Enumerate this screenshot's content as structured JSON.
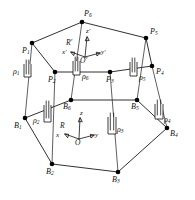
{
  "figure": {
    "background_color": "#ffffff",
    "line_color": "#1a1a1a"
  },
  "platform_nodes": [
    {
      "id": "P1",
      "base": "P",
      "sub": "1",
      "x": 32,
      "y": 43
    },
    {
      "id": "P2",
      "base": "P",
      "sub": "2",
      "x": 55,
      "y": 72
    },
    {
      "id": "P3",
      "base": "P",
      "sub": "3",
      "x": 110,
      "y": 72
    },
    {
      "id": "P4",
      "base": "P",
      "sub": "4",
      "x": 152,
      "y": 66
    },
    {
      "id": "P5",
      "base": "P",
      "sub": "5",
      "x": 146,
      "y": 38
    },
    {
      "id": "P6",
      "base": "P",
      "sub": "6",
      "x": 82,
      "y": 22
    }
  ],
  "base_nodes": [
    {
      "id": "B1",
      "base": "B",
      "sub": "1",
      "x": 25,
      "y": 118
    },
    {
      "id": "B2",
      "base": "B",
      "sub": "2",
      "x": 52,
      "y": 164
    },
    {
      "id": "B3",
      "base": "B",
      "sub": "3",
      "x": 118,
      "y": 172
    },
    {
      "id": "B4",
      "base": "B",
      "sub": "4",
      "x": 167,
      "y": 128
    },
    {
      "id": "B5",
      "base": "B",
      "sub": "5",
      "x": 137,
      "y": 100
    },
    {
      "id": "B6",
      "base": "B",
      "sub": "6",
      "x": 71,
      "y": 100
    }
  ],
  "actuators": [
    {
      "id": "rho1",
      "base": "ρ",
      "sub": "1",
      "label_x": 13,
      "label_y": 72
    },
    {
      "id": "rho2",
      "base": "ρ",
      "sub": "2",
      "label_x": 33,
      "label_y": 121
    },
    {
      "id": "rho3",
      "base": "ρ",
      "sub": "3",
      "label_x": 115,
      "label_y": 130
    },
    {
      "id": "rho4",
      "base": "ρ",
      "sub": "4",
      "label_x": 163,
      "label_y": 120
    },
    {
      "id": "rho5",
      "base": "ρ",
      "sub": "5",
      "label_x": 138,
      "label_y": 78
    },
    {
      "id": "rho6",
      "base": "ρ",
      "sub": "6",
      "label_x": 82,
      "label_y": 77
    }
  ],
  "frames": [
    {
      "id": "upper-frame",
      "name": "R'",
      "origin_label": "O'",
      "origin_x": 85,
      "origin_y": 57,
      "axes": [
        {
          "id": "z-prime",
          "label": "z'",
          "label_x": 88,
          "label_y": 33
        },
        {
          "id": "y-prime",
          "label": "y'",
          "label_x": 103,
          "label_y": 53
        },
        {
          "id": "x-prime",
          "label": "x'",
          "label_x": 64,
          "label_y": 53
        }
      ],
      "frame_label_x": 68,
      "frame_label_y": 43
    },
    {
      "id": "base-frame",
      "name": "R",
      "origin_label": "O",
      "origin_x": 79,
      "origin_y": 139,
      "axes": [
        {
          "id": "z-axis",
          "label": "z",
          "label_x": 82,
          "label_y": 114
        },
        {
          "id": "y-axis",
          "label": "y",
          "label_x": 97,
          "label_y": 136
        },
        {
          "id": "x-axis",
          "label": "x",
          "label_x": 58,
          "label_y": 136
        }
      ],
      "frame_label_x": 62,
      "frame_label_y": 126
    }
  ]
}
